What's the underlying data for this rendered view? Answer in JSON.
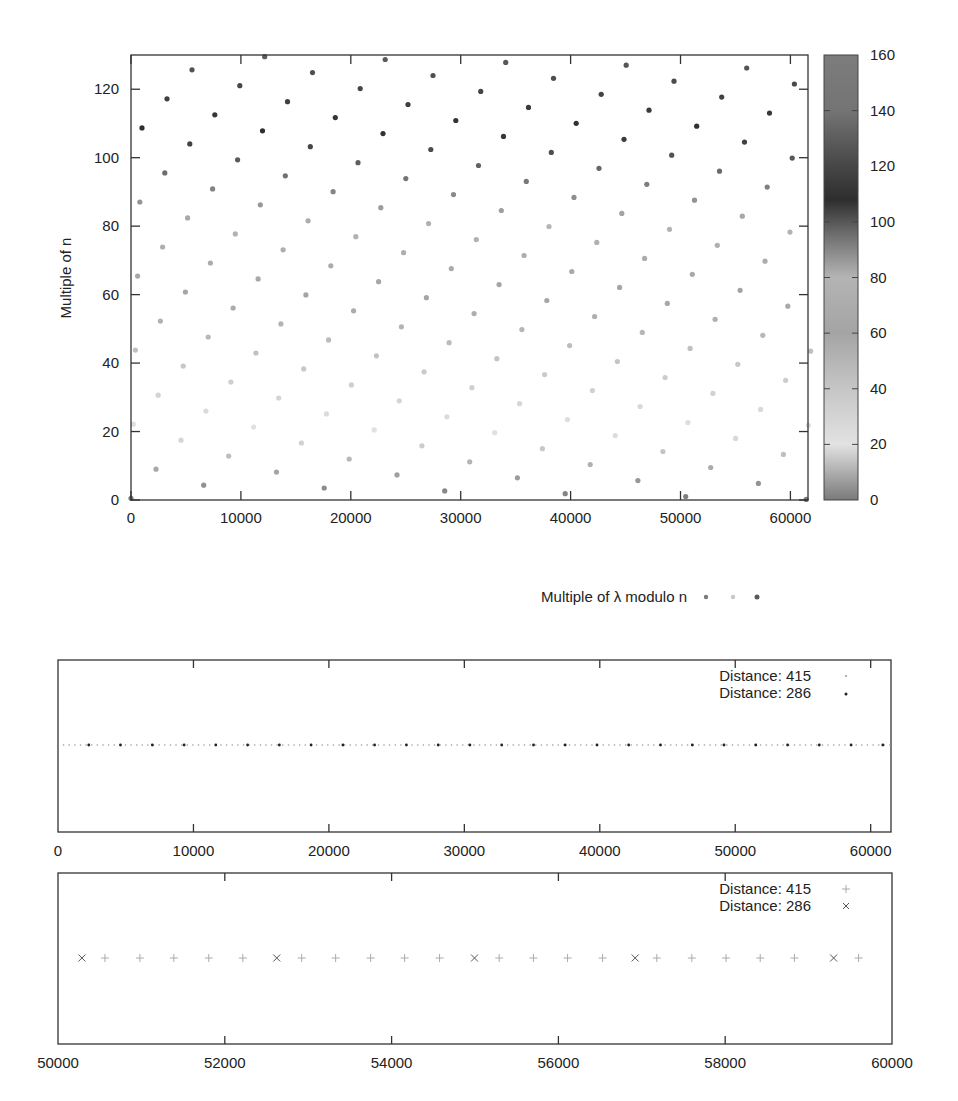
{
  "chart_data": [
    {
      "type": "scatter",
      "title": "",
      "xlabel": "",
      "ylabel": "Multiple of n",
      "xlim": [
        0,
        61600
      ],
      "ylim": [
        0,
        130
      ],
      "xticks": [
        0,
        10000,
        20000,
        30000,
        40000,
        50000,
        60000
      ],
      "yticks": [
        0,
        20,
        40,
        60,
        80,
        100,
        120
      ],
      "grid": false,
      "colorbar": {
        "range": [
          0,
          160
        ],
        "ticks": [
          0,
          20,
          40,
          60,
          80,
          100,
          120,
          140,
          160
        ],
        "colormap_stops": [
          {
            "value": 0,
            "color": "#7a7a7a"
          },
          {
            "value": 20,
            "color": "#e2e2e2"
          },
          {
            "value": 40,
            "color": "#c6c6c6"
          },
          {
            "value": 60,
            "color": "#a4a4a4"
          },
          {
            "value": 80,
            "color": "#b4b4b4"
          },
          {
            "value": 95,
            "color": "#707070"
          },
          {
            "value": 108,
            "color": "#2e2e2e"
          },
          {
            "value": 122,
            "color": "#4a4a4a"
          },
          {
            "value": 140,
            "color": "#747474"
          },
          {
            "value": 160,
            "color": "#7c7c7c"
          }
        ]
      },
      "lattice": {
        "description": "points = origin + i*v + j*u, clipped to axis ranges; color by y value",
        "origin": [
          0,
          0.5
        ],
        "v": [
          2273,
          8.49
        ],
        "u": [
          4345,
          -4.66
        ]
      },
      "legend": {
        "label": "Multiple of λ modulo n",
        "position": "below",
        "marker_colors": [
          "#7a7a7a",
          "#c8c8c8",
          "#5a5a5a"
        ]
      }
    },
    {
      "type": "scatter",
      "title": "",
      "xlim": [
        0,
        61500
      ],
      "xticks": [
        0,
        10000,
        20000,
        30000,
        40000,
        50000,
        60000
      ],
      "y_constant": 0.5,
      "series": [
        {
          "name": "Distance: 415",
          "marker": "dot-small",
          "color": "#9a9a9a",
          "start": 0,
          "step": 415
        },
        {
          "name": "Distance: 286",
          "marker": "dot",
          "color": "#222222",
          "start": 2273,
          "step": 2345,
          "note": "approx. every ~2345 units"
        }
      ],
      "legend": {
        "position": "top-right",
        "entries": [
          "Distance: 415",
          "Distance: 286"
        ]
      }
    },
    {
      "type": "scatter",
      "title": "",
      "xlim": [
        50000,
        60000
      ],
      "xticks": [
        50000,
        52000,
        54000,
        56000,
        58000,
        60000
      ],
      "y_constant": 0.5,
      "series": [
        {
          "name": "Distance: 415",
          "marker": "plus",
          "color": "#9a9a9a",
          "x": [
            50563,
            50982,
            51389,
            51808,
            52216,
            52922,
            53329,
            53749,
            54156,
            54575,
            55290,
            55700,
            56110,
            56530,
            57180,
            57600,
            58010,
            58420,
            58830,
            59600
          ]
        },
        {
          "name": "Distance: 286",
          "marker": "cross",
          "color": "#555555",
          "x": [
            50287,
            52623,
            54994,
            56920,
            59300
          ]
        }
      ],
      "legend": {
        "position": "top-right",
        "entries": [
          "Distance: 415",
          "Distance: 286"
        ]
      }
    }
  ],
  "plot1": {
    "ylabel": "Multiple of n",
    "xtick_labels": [
      "0",
      "10000",
      "20000",
      "30000",
      "40000",
      "50000",
      "60000"
    ],
    "ytick_labels": [
      "0",
      "20",
      "40",
      "60",
      "80",
      "100",
      "120"
    ],
    "colorbar_labels": [
      "0",
      "20",
      "40",
      "60",
      "80",
      "100",
      "120",
      "140",
      "160"
    ],
    "legend_label": "Multiple of λ modulo n"
  },
  "plot2": {
    "xtick_labels": [
      "0",
      "10000",
      "20000",
      "30000",
      "40000",
      "50000",
      "60000"
    ],
    "legend": [
      "Distance: 415",
      "Distance: 286"
    ]
  },
  "plot3": {
    "xtick_labels": [
      "50000",
      "52000",
      "54000",
      "56000",
      "58000",
      "60000"
    ],
    "legend": [
      "Distance: 415",
      "Distance: 286"
    ]
  }
}
